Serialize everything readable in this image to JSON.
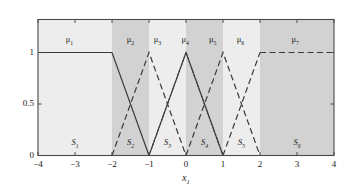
{
  "chart_data": {
    "type": "line",
    "title": "",
    "xlabel": "x₁",
    "ylabel": "",
    "xlim": [
      -4,
      4
    ],
    "ylim": [
      0,
      1
    ],
    "xticks": [
      -4,
      -3,
      -2,
      -1,
      0,
      1,
      2,
      3,
      4
    ],
    "xticklabels": [
      "−4",
      "−3",
      "−2",
      "−1",
      "0",
      "1",
      "2",
      "3",
      "4"
    ],
    "yticks": [
      0,
      0.5,
      1
    ],
    "yticklabels": [
      "0",
      "0.5",
      "1"
    ],
    "grid": false,
    "legend": "none",
    "series": [
      {
        "name": "μ₁",
        "label": "μ₁",
        "style": "solid",
        "x": [
          -4,
          -2,
          -1
        ],
        "y": [
          1,
          1,
          0
        ]
      },
      {
        "name": "μ₂",
        "label": "μ₂",
        "style": "dashed",
        "x": [
          -2,
          -1,
          0
        ],
        "y": [
          0,
          1,
          0
        ]
      },
      {
        "name": "μ₃",
        "label": "μ₃",
        "style": "dotted",
        "x": [
          -1,
          0,
          1
        ],
        "y": [
          0,
          1,
          0
        ]
      },
      {
        "name": "μ₄",
        "label": "μ₄",
        "style": "solid",
        "x": [
          -1,
          0,
          1
        ],
        "y": [
          0,
          1,
          0
        ]
      },
      {
        "name": "μ₅",
        "label": "μ₅",
        "style": "dashed",
        "x": [
          0,
          1,
          2
        ],
        "y": [
          0,
          1,
          0
        ]
      },
      {
        "name": "μ₆",
        "label": "μ₆",
        "style": "dashed",
        "x": [
          1,
          2
        ],
        "y": [
          0,
          1
        ]
      },
      {
        "name": "μ₇",
        "label": "μ₇",
        "style": "dashed",
        "x": [
          2,
          4
        ],
        "y": [
          1,
          1
        ]
      }
    ],
    "mu_labels": [
      {
        "text": "μ₁",
        "x": -3.15,
        "y": 1.18
      },
      {
        "text": "μ₂",
        "x": -1.5,
        "y": 1.18
      },
      {
        "text": "μ₃",
        "x": -0.77,
        "y": 1.18
      },
      {
        "text": "μ₄",
        "x": -0.02,
        "y": 1.18
      },
      {
        "text": "μ₅",
        "x": 0.72,
        "y": 1.18
      },
      {
        "text": "μ₆",
        "x": 1.47,
        "y": 1.18
      },
      {
        "text": "μ₇",
        "x": 2.95,
        "y": 1.18
      }
    ],
    "region_labels": [
      {
        "text": "S₁",
        "x": -3.0,
        "y": 0.12
      },
      {
        "text": "S₂",
        "x": -1.5,
        "y": 0.12
      },
      {
        "text": "S₃",
        "x": -0.5,
        "y": 0.12
      },
      {
        "text": "S₄",
        "x": 0.5,
        "y": 0.12
      },
      {
        "text": "S₅",
        "x": 1.5,
        "y": 0.12
      },
      {
        "text": "S₆",
        "x": 3.0,
        "y": 0.12
      }
    ],
    "regions": [
      {
        "name": "S₁",
        "x0": -4,
        "x1": -2,
        "shade": "light"
      },
      {
        "name": "S₂",
        "x0": -2,
        "x1": -1,
        "shade": "dark"
      },
      {
        "name": "S₃",
        "x0": -1,
        "x1": 0,
        "shade": "light"
      },
      {
        "name": "S₄",
        "x0": 0,
        "x1": 1,
        "shade": "dark"
      },
      {
        "name": "S₅",
        "x0": 1,
        "x1": 2,
        "shade": "light"
      },
      {
        "name": "S₆",
        "x0": 2,
        "x1": 4,
        "shade": "dark"
      }
    ],
    "colors": {
      "shade_light": "#ededed",
      "shade_dark": "#d2d2d2",
      "line": "#3a3a3a",
      "axis": "#4a4a4a",
      "text": "#1a1a1a",
      "background": "#ffffff"
    }
  }
}
